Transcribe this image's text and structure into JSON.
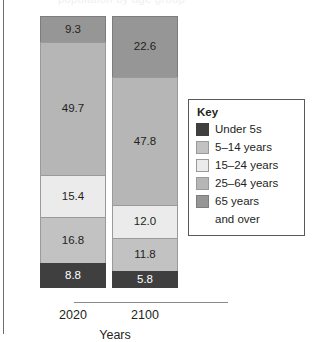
{
  "figure": {
    "clipped_title": "population by age group",
    "y_axis_label": "Percentage share of population",
    "x_axis_label": "Years"
  },
  "legend": {
    "title": "Key",
    "items": [
      {
        "label": "Under 5s",
        "color": "#3f3f3f",
        "border": "#3f3f3f"
      },
      {
        "label": "5–14 years",
        "color": "#c2c2c2",
        "border": "#9a9a9a"
      },
      {
        "label": "15–24 years",
        "color": "#ebebeb",
        "border": "#9a9a9a"
      },
      {
        "label": "25–64 years",
        "color": "#b6b6b6",
        "border": "#9a9a9a"
      },
      {
        "label": "65 years",
        "color": "#969696",
        "border": "#7d7d7d",
        "label2": "and over"
      }
    ]
  },
  "chart_data": {
    "type": "bar",
    "stacked": true,
    "title": "",
    "xlabel": "Years",
    "ylabel": "Percentage share of population",
    "ylim": [
      0,
      100
    ],
    "grid": false,
    "legend_position": "right",
    "categories": [
      "2020",
      "2100"
    ],
    "series": [
      {
        "name": "Under 5s",
        "color": "#3f3f3f",
        "text_color": "#ffffff",
        "values": [
          8.8,
          5.8
        ],
        "labels": [
          "8.8",
          "5.8"
        ]
      },
      {
        "name": "5–14 years",
        "color": "#c2c2c2",
        "text_color": "#231f20",
        "values": [
          16.8,
          11.8
        ],
        "labels": [
          "16.8",
          "11.8"
        ]
      },
      {
        "name": "15–24 years",
        "color": "#ebebeb",
        "text_color": "#231f20",
        "values": [
          15.4,
          12.0
        ],
        "labels": [
          "15.4",
          "12.0"
        ]
      },
      {
        "name": "25–64 years",
        "color": "#b6b6b6",
        "text_color": "#231f20",
        "values": [
          49.7,
          47.8
        ],
        "labels": [
          "49.7",
          "47.8"
        ]
      },
      {
        "name": "65 years and over",
        "color": "#969696",
        "text_color": "#231f20",
        "values": [
          9.3,
          22.6
        ],
        "labels": [
          "9.3",
          "22.6"
        ]
      }
    ],
    "bars": [
      {
        "category": "2020",
        "total": 100.0,
        "segments": [
          {
            "series": "65 years and over",
            "value": 9.3,
            "label": "9.3"
          },
          {
            "series": "25–64 years",
            "value": 49.7,
            "label": "49.7"
          },
          {
            "series": "15–24 years",
            "value": 15.4,
            "label": "15.4"
          },
          {
            "series": "5–14 years",
            "value": 16.8,
            "label": "16.8"
          },
          {
            "series": "Under 5s",
            "value": 8.8,
            "label": "8.8"
          }
        ]
      },
      {
        "category": "2100",
        "total": 100.0,
        "segments": [
          {
            "series": "65 years and over",
            "value": 22.6,
            "label": "22.6"
          },
          {
            "series": "25–64 years",
            "value": 47.8,
            "label": "47.8"
          },
          {
            "series": "15–24 years",
            "value": 12.0,
            "label": "12.0"
          },
          {
            "series": "5–14 years",
            "value": 11.8,
            "label": "11.8"
          },
          {
            "series": "Under 5s",
            "value": 5.8,
            "label": "5.8"
          }
        ]
      }
    ]
  }
}
